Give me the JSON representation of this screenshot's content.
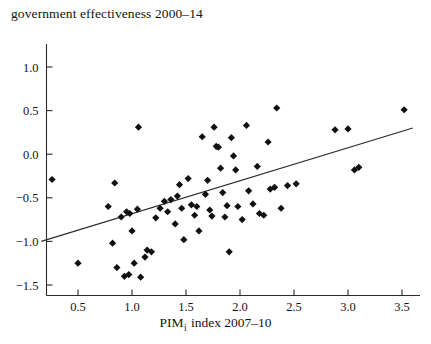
{
  "chart_data": {
    "type": "scatter",
    "title": "government effectiveness 2000–14",
    "xlabel_prefix": "PIM",
    "xlabel_sub": "i",
    "xlabel_suffix": " index 2007–10",
    "xlabel": "PIM i index 2007–10",
    "ylabel": "government effectiveness 2000–14",
    "grid": false,
    "legend": "none",
    "xlim": [
      0.13,
      3.72
    ],
    "ylim": [
      -1.62,
      1.28
    ],
    "xticks": [
      0.5,
      1.0,
      1.5,
      2.0,
      2.5,
      3.0,
      3.5
    ],
    "xtick_labels": [
      "0.5",
      "1.0",
      "1.5",
      "2.0",
      "2.5",
      "3.0",
      "3.5"
    ],
    "yticks": [
      1.0,
      0.5,
      0.0,
      -0.5,
      -1.0,
      -1.5
    ],
    "ytick_labels": [
      "1.0",
      "0.5",
      "0.0",
      "−0.5",
      "−1.0",
      "−1.5"
    ],
    "marker_style": "filled-diamond",
    "marker_color": "#111111",
    "trendline": {
      "type": "linear-fit",
      "color": "#2b2b2b",
      "x_start": 0.16,
      "y_start": -1.0,
      "x_end": 3.6,
      "y_end": 0.3
    },
    "points": [
      [
        0.26,
        -0.29
      ],
      [
        0.5,
        -1.25
      ],
      [
        0.78,
        -0.6
      ],
      [
        0.82,
        -1.02
      ],
      [
        0.84,
        -0.33
      ],
      [
        0.86,
        -1.3
      ],
      [
        0.9,
        -0.72
      ],
      [
        0.93,
        -1.4
      ],
      [
        0.95,
        -0.66
      ],
      [
        0.97,
        -1.38
      ],
      [
        0.98,
        -0.68
      ],
      [
        1.0,
        -0.88
      ],
      [
        1.02,
        -1.25
      ],
      [
        1.05,
        -0.63
      ],
      [
        1.06,
        0.31
      ],
      [
        1.08,
        -1.41
      ],
      [
        1.12,
        -1.18
      ],
      [
        1.14,
        -1.1
      ],
      [
        1.18,
        -1.12
      ],
      [
        1.22,
        -0.73
      ],
      [
        1.26,
        -0.62
      ],
      [
        1.3,
        -0.54
      ],
      [
        1.33,
        -0.66
      ],
      [
        1.36,
        -0.52
      ],
      [
        1.4,
        -0.8
      ],
      [
        1.42,
        -0.48
      ],
      [
        1.44,
        -0.35
      ],
      [
        1.46,
        -0.62
      ],
      [
        1.48,
        -0.98
      ],
      [
        1.52,
        -0.28
      ],
      [
        1.55,
        -0.58
      ],
      [
        1.58,
        -0.7
      ],
      [
        1.6,
        -0.6
      ],
      [
        1.62,
        -0.88
      ],
      [
        1.65,
        0.2
      ],
      [
        1.68,
        -0.46
      ],
      [
        1.7,
        -0.3
      ],
      [
        1.72,
        -0.64
      ],
      [
        1.74,
        -0.71
      ],
      [
        1.76,
        0.31
      ],
      [
        1.78,
        0.09
      ],
      [
        1.8,
        0.08
      ],
      [
        1.82,
        -0.16
      ],
      [
        1.84,
        -0.44
      ],
      [
        1.86,
        -0.72
      ],
      [
        1.88,
        -0.59
      ],
      [
        1.9,
        -1.12
      ],
      [
        1.92,
        0.19
      ],
      [
        1.94,
        -0.02
      ],
      [
        1.96,
        -0.18
      ],
      [
        1.98,
        -0.6
      ],
      [
        2.02,
        -0.75
      ],
      [
        2.06,
        0.33
      ],
      [
        2.08,
        -0.42
      ],
      [
        2.12,
        -0.57
      ],
      [
        2.16,
        -0.14
      ],
      [
        2.18,
        -0.68
      ],
      [
        2.22,
        -0.7
      ],
      [
        2.26,
        0.14
      ],
      [
        2.28,
        -0.4
      ],
      [
        2.32,
        -0.38
      ],
      [
        2.34,
        0.53
      ],
      [
        2.38,
        -0.62
      ],
      [
        2.44,
        -0.36
      ],
      [
        2.52,
        -0.34
      ],
      [
        2.88,
        0.28
      ],
      [
        3.0,
        0.29
      ],
      [
        3.06,
        -0.18
      ],
      [
        3.1,
        -0.15
      ],
      [
        3.52,
        0.51
      ]
    ]
  }
}
